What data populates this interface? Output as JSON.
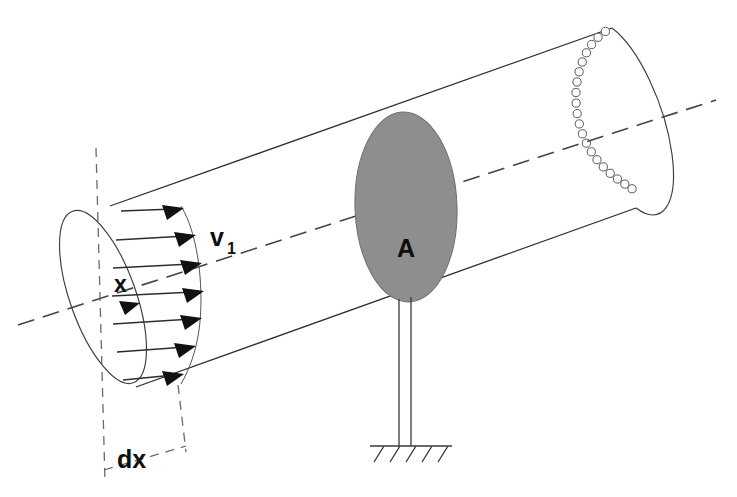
{
  "figure": {
    "background_color": "#ffffff",
    "width": 737,
    "height": 497
  },
  "labels": {
    "velocity": "v",
    "velocity_subscript": "1",
    "axis": "x",
    "area": "A",
    "element_length": "dx"
  },
  "colors": {
    "disc_fill": "#8e8e8e",
    "disc_stroke": "#6d6d6d",
    "line": "#2e2e2e",
    "centerline": "#444444",
    "dimension": "#6a6a6a",
    "background": "#ffffff"
  },
  "geometry": {
    "duct": {
      "type": "cylinder",
      "top_edge": "M 110,206 L 612,28",
      "bottom_edge": "M 136,387 L 636,208",
      "left_face_center": [
        103,
        297
      ],
      "left_face_rx": 33,
      "left_face_ry": 91,
      "right_face_center": [
        622,
        118
      ],
      "right_face_rx": 34,
      "right_face_ry": 91
    },
    "centerline": {
      "start": [
        18,
        325
      ],
      "end": [
        716,
        100
      ],
      "dash": "17 9"
    },
    "velocity_profile": {
      "arrow_count": 7,
      "description": "Uniform flow arrows from inlet face toward profile boundary",
      "arrows": [
        {
          "x1": 122,
          "y1": 211,
          "x2": 181,
          "y2": 210
        },
        {
          "x1": 117,
          "y1": 240,
          "x2": 193,
          "y2": 236
        },
        {
          "x1": 114,
          "y1": 269,
          "x2": 199,
          "y2": 264
        },
        {
          "x1": 113,
          "y1": 296,
          "x2": 201,
          "y2": 291
        },
        {
          "x1": 114,
          "y1": 324,
          "x2": 199,
          "y2": 318
        },
        {
          "x1": 117,
          "y1": 352,
          "x2": 193,
          "y2": 346
        },
        {
          "x1": 123,
          "y1": 380,
          "x2": 181,
          "y2": 373
        }
      ]
    },
    "disc": {
      "center": [
        406,
        207
      ],
      "rx": 51,
      "ry": 95,
      "rotation_deg": -2
    },
    "support": {
      "post_left_x": 399,
      "post_right_x": 411,
      "post_top_y": 298,
      "post_bottom_y": 446,
      "ground_line": {
        "x1": 370,
        "y1": 446,
        "x2": 452,
        "y2": 446
      },
      "hatch_count": 5
    },
    "right_face_hidden_dots": {
      "count": 20,
      "radius": 4.1,
      "description": "Small open circles tracing hidden rear half of the outlet ellipse"
    },
    "dx_dimension": {
      "left_line": {
        "x1": 96,
        "y1": 148,
        "x2": 105,
        "y2": 482
      },
      "right_line": {
        "x1": 177,
        "y1": 385,
        "x2": 186,
        "y2": 452
      },
      "connector": {
        "x1": 105,
        "y1": 470,
        "x2": 186,
        "y2": 445
      },
      "label_position": [
        122,
        460
      ]
    }
  },
  "label_positions": {
    "velocity": [
      212,
      238
    ],
    "axis": [
      121,
      290
    ],
    "area": [
      404,
      253
    ],
    "element_length": [
      119,
      462
    ]
  }
}
